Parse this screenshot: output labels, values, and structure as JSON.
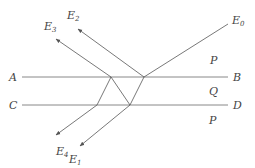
{
  "figure": {
    "type": "optics-ray-diagram",
    "colors": {
      "line": "#7a7a7a",
      "ray": "#555555",
      "text": "#444444",
      "background": "#ffffff"
    }
  },
  "labels": {
    "A": "A",
    "B": "B",
    "C": "C",
    "D": "D",
    "P_top": "P",
    "Q": "Q",
    "P_bottom": "P",
    "E0": {
      "main": "E",
      "sub": "0"
    },
    "E1": {
      "main": "E",
      "sub": "1"
    },
    "E2": {
      "main": "E",
      "sub": "2"
    },
    "E3": {
      "main": "E",
      "sub": "3"
    },
    "E4": {
      "main": "E",
      "sub": "4"
    }
  },
  "geometry": {
    "line_AB": {
      "x1": 22,
      "y1": 77,
      "x2": 228,
      "y2": 77
    },
    "line_CD": {
      "x1": 22,
      "y1": 105,
      "x2": 228,
      "y2": 105
    },
    "points": {
      "AB_right": [
        144,
        77
      ],
      "AB_left": [
        111,
        77
      ],
      "CD_right": [
        130,
        105
      ],
      "CD_left": [
        97,
        105
      ]
    }
  }
}
